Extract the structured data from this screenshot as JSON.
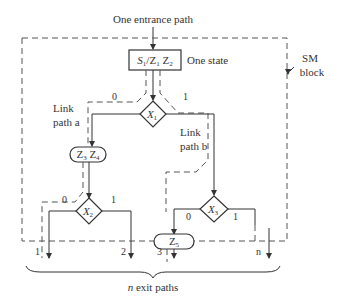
{
  "diagram": {
    "entrance_label": "One entrance path",
    "block_label_line1": "SM",
    "block_label_line2": "block",
    "state": {
      "label_main": "S",
      "label_sub": "1",
      "label_rest": "/Z",
      "label_rest_sub": "1",
      "label_z2": " Z",
      "label_z2_sub": "2",
      "note": "One state"
    },
    "decisions": [
      {
        "id": "X1",
        "var": "X",
        "sub": "1",
        "branch0": "0",
        "branch1": "1"
      },
      {
        "id": "X2",
        "var": "X",
        "sub": "2",
        "branch0": "0",
        "branch1": "1"
      },
      {
        "id": "X3",
        "var": "X",
        "sub": "3",
        "branch0": "0",
        "branch1": "1"
      }
    ],
    "conditional_outputs": [
      {
        "id": "Z3Z4",
        "a": "Z",
        "a_sub": "3",
        "b": " Z",
        "b_sub": "4"
      },
      {
        "id": "Z5",
        "a": "Z",
        "a_sub": "5"
      }
    ],
    "link_path_a": {
      "line1": "Link",
      "line2": "path a"
    },
    "link_path_b": {
      "line1": "Link",
      "line2": "path b"
    },
    "exits": [
      "1",
      "2",
      "3",
      "n"
    ],
    "exit_caption_italic": "n",
    "exit_caption_rest": " exit paths"
  }
}
